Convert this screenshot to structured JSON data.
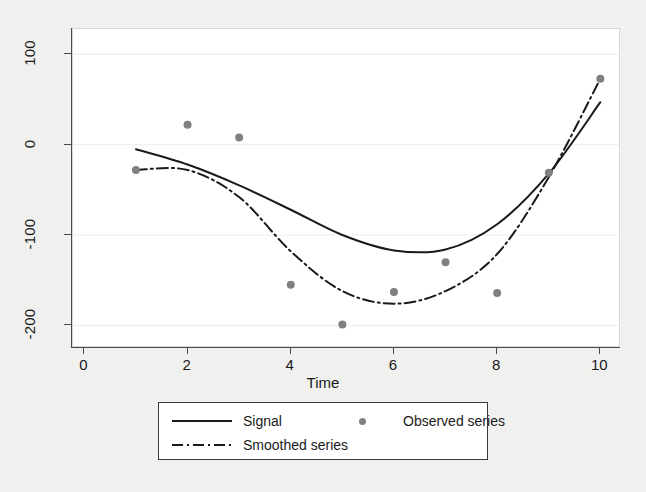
{
  "chart_data": {
    "type": "line",
    "title": "",
    "subtitle": "",
    "xlabel": "Time",
    "ylabel": "",
    "xlim": [
      -0.22,
      10.4
    ],
    "ylim": [
      -225,
      128
    ],
    "xticks": [
      0,
      2,
      4,
      6,
      8,
      10
    ],
    "xticklabels": [
      "0",
      "2",
      "4",
      "6",
      "8",
      "10"
    ],
    "yticks": [
      100,
      0,
      -100,
      -200
    ],
    "yticklabels": [
      "100",
      "0",
      "-100",
      "-200"
    ],
    "grid": "horizontal-only",
    "legend_position": "below-axes",
    "series": [
      {
        "name": "Signal",
        "style": "solid",
        "color": "#1a1a1a",
        "x": [
          1,
          2,
          3,
          4,
          5,
          6,
          7,
          8,
          9,
          10
        ],
        "values": [
          -5,
          -22,
          -45,
          -72,
          -100,
          -117,
          -116,
          -88,
          -32,
          47
        ]
      },
      {
        "name": "Smoothed series",
        "style": "dash-dot",
        "color": "#1a1a1a",
        "x": [
          1,
          2,
          3,
          4,
          5,
          6,
          7,
          8,
          9,
          10
        ],
        "values": [
          -28,
          -28,
          -58,
          -118,
          -162,
          -176,
          -162,
          -121,
          -36,
          73
        ]
      },
      {
        "name": "Observed series",
        "style": "markers",
        "color": "#808080",
        "x": [
          1,
          2,
          3,
          4,
          5,
          6,
          7,
          8,
          9,
          10
        ],
        "values": [
          -28,
          22,
          8,
          -155,
          -199,
          -163,
          -130,
          -164,
          -31,
          73
        ]
      }
    ]
  },
  "axes": {
    "x_title": "Time",
    "x_tick_labels": [
      "0",
      "2",
      "4",
      "6",
      "8",
      "10"
    ],
    "y_tick_labels": [
      "100",
      "0",
      "-100",
      "-200"
    ]
  },
  "legend": {
    "entries": [
      {
        "label": "Signal",
        "key": "solid-line"
      },
      {
        "label": "Smoothed series",
        "key": "dash-dot-line"
      },
      {
        "label": "Observed series",
        "key": "gray-dot-marker"
      }
    ]
  },
  "colors": {
    "line": "#1a1a1a",
    "marker": "#808080",
    "grid": "#ececec",
    "axis": "#4a4a4a",
    "plot_background": "#ffffff",
    "figure_background": "#f0f0ef"
  }
}
